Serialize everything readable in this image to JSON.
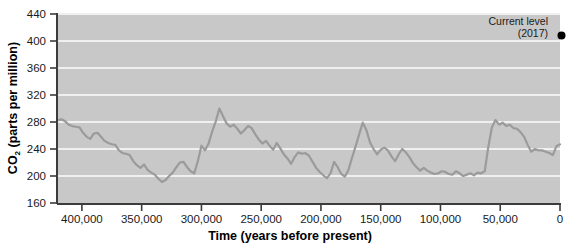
{
  "chart_data": {
    "type": "line",
    "title": "",
    "subtitle": "",
    "xlabel": "Time (years before present)",
    "ylabel": "CO2 (parts per million)",
    "ylabel_base": "CO",
    "ylabel_sub": "2",
    "ylabel_rest": " (parts per million)",
    "xlim": [
      420000,
      0
    ],
    "ylim": [
      160,
      440
    ],
    "x_reversed": true,
    "grid": "horizontal",
    "legend": "none",
    "x_ticks": [
      400000,
      350000,
      300000,
      250000,
      200000,
      150000,
      100000,
      50000,
      0
    ],
    "x_tick_labels": [
      "400,000",
      "350,000",
      "300,000",
      "250,000",
      "200,000",
      "150,000",
      "100,000",
      "50,000",
      "0"
    ],
    "y_ticks": [
      160,
      200,
      240,
      280,
      320,
      360,
      400,
      440
    ],
    "y_tick_labels": [
      "160",
      "200",
      "240",
      "280",
      "320",
      "360",
      "400",
      "440"
    ],
    "series": [
      {
        "name": "Ice core CO2 record",
        "color": "#9b9b9b",
        "points": [
          [
            420000,
            283
          ],
          [
            417000,
            284
          ],
          [
            414000,
            281
          ],
          [
            411000,
            276
          ],
          [
            408000,
            274
          ],
          [
            405000,
            273
          ],
          [
            402000,
            272
          ],
          [
            399000,
            264
          ],
          [
            396000,
            258
          ],
          [
            393000,
            255
          ],
          [
            390000,
            263
          ],
          [
            387000,
            264
          ],
          [
            384000,
            258
          ],
          [
            381000,
            252
          ],
          [
            378000,
            249
          ],
          [
            375000,
            247
          ],
          [
            372000,
            246
          ],
          [
            369000,
            238
          ],
          [
            366000,
            234
          ],
          [
            363000,
            233
          ],
          [
            360000,
            231
          ],
          [
            357000,
            222
          ],
          [
            354000,
            216
          ],
          [
            351000,
            212
          ],
          [
            348000,
            217
          ],
          [
            345000,
            209
          ],
          [
            342000,
            205
          ],
          [
            339000,
            202
          ],
          [
            336000,
            196
          ],
          [
            333000,
            191
          ],
          [
            330000,
            194
          ],
          [
            327000,
            200
          ],
          [
            324000,
            205
          ],
          [
            321000,
            213
          ],
          [
            318000,
            220
          ],
          [
            315000,
            221
          ],
          [
            312000,
            213
          ],
          [
            309000,
            207
          ],
          [
            306000,
            204
          ],
          [
            303000,
            222
          ],
          [
            300000,
            245
          ],
          [
            297000,
            238
          ],
          [
            294000,
            248
          ],
          [
            291000,
            266
          ],
          [
            288000,
            281
          ],
          [
            285000,
            300
          ],
          [
            282000,
            289
          ],
          [
            279000,
            278
          ],
          [
            276000,
            273
          ],
          [
            273000,
            276
          ],
          [
            270000,
            270
          ],
          [
            267000,
            263
          ],
          [
            264000,
            268
          ],
          [
            261000,
            274
          ],
          [
            258000,
            271
          ],
          [
            255000,
            262
          ],
          [
            252000,
            254
          ],
          [
            249000,
            248
          ],
          [
            246000,
            252
          ],
          [
            243000,
            245
          ],
          [
            240000,
            239
          ],
          [
            237000,
            249
          ],
          [
            234000,
            241
          ],
          [
            231000,
            232
          ],
          [
            228000,
            226
          ],
          [
            225000,
            218
          ],
          [
            222000,
            228
          ],
          [
            219000,
            235
          ],
          [
            216000,
            233
          ],
          [
            213000,
            234
          ],
          [
            210000,
            230
          ],
          [
            207000,
            221
          ],
          [
            204000,
            212
          ],
          [
            201000,
            206
          ],
          [
            198000,
            201
          ],
          [
            195000,
            197
          ],
          [
            192000,
            204
          ],
          [
            189000,
            221
          ],
          [
            186000,
            213
          ],
          [
            183000,
            203
          ],
          [
            180000,
            199
          ],
          [
            177000,
            209
          ],
          [
            174000,
            227
          ],
          [
            171000,
            244
          ],
          [
            168000,
            262
          ],
          [
            165000,
            279
          ],
          [
            162000,
            268
          ],
          [
            159000,
            250
          ],
          [
            156000,
            240
          ],
          [
            153000,
            232
          ],
          [
            150000,
            239
          ],
          [
            147000,
            242
          ],
          [
            144000,
            238
          ],
          [
            141000,
            229
          ],
          [
            138000,
            222
          ],
          [
            135000,
            232
          ],
          [
            132000,
            240
          ],
          [
            129000,
            235
          ],
          [
            126000,
            228
          ],
          [
            123000,
            219
          ],
          [
            120000,
            213
          ],
          [
            117000,
            208
          ],
          [
            114000,
            212
          ],
          [
            111000,
            208
          ],
          [
            108000,
            205
          ],
          [
            105000,
            203
          ],
          [
            102000,
            204
          ],
          [
            99000,
            207
          ],
          [
            96000,
            206
          ],
          [
            93000,
            203
          ],
          [
            90000,
            202
          ],
          [
            87000,
            207
          ],
          [
            84000,
            204
          ],
          [
            81000,
            200
          ],
          [
            78000,
            202
          ],
          [
            75000,
            204
          ],
          [
            72000,
            201
          ],
          [
            69000,
            205
          ],
          [
            66000,
            204
          ],
          [
            63000,
            207
          ],
          [
            60000,
            243
          ],
          [
            57000,
            272
          ],
          [
            54000,
            283
          ],
          [
            51000,
            276
          ],
          [
            48000,
            279
          ],
          [
            45000,
            274
          ],
          [
            42000,
            276
          ],
          [
            39000,
            271
          ],
          [
            36000,
            270
          ],
          [
            33000,
            265
          ],
          [
            30000,
            258
          ],
          [
            27000,
            246
          ],
          [
            24000,
            236
          ],
          [
            21000,
            240
          ],
          [
            18000,
            238
          ],
          [
            15000,
            238
          ],
          [
            12000,
            236
          ],
          [
            9000,
            234
          ],
          [
            6000,
            231
          ],
          [
            3000,
            244
          ],
          [
            0,
            247
          ]
        ]
      }
    ],
    "annotations": [
      {
        "name": "current-level",
        "line1": "Current level",
        "line2": "(2017)",
        "x": 0,
        "y": 408,
        "marker": "dot",
        "marker_color": "#000000"
      }
    ],
    "colors": {
      "plot_background": "#c8c8c8",
      "page_background": "#ffffff",
      "gridline": "#f0f0f0",
      "axis": "#3c3c3c",
      "series": "#9b9b9b",
      "text": "#1a1a1a"
    }
  }
}
